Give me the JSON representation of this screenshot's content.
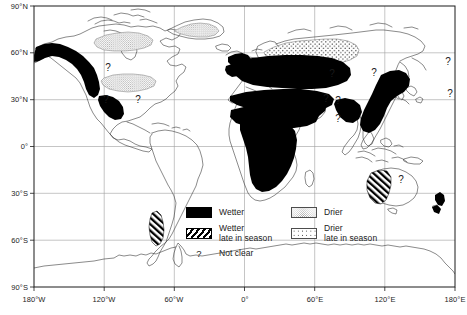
{
  "figure": {
    "type": "map",
    "projection": "equirectangular",
    "title": "",
    "frame": {
      "x_min_deg": -180,
      "x_max_deg": 180,
      "y_min_deg": -90,
      "y_max_deg": 90
    }
  },
  "axes": {
    "y_ticks": [
      {
        "label": "90°N",
        "value": 90
      },
      {
        "label": "60°N",
        "value": 60
      },
      {
        "label": "30°N",
        "value": 30
      },
      {
        "label": "0°",
        "value": 0
      },
      {
        "label": "30°S",
        "value": -30
      },
      {
        "label": "60°S",
        "value": -60
      },
      {
        "label": "90°S",
        "value": -90
      }
    ],
    "x_ticks": [
      {
        "label": "180°W",
        "value": -180
      },
      {
        "label": "120°W",
        "value": -120
      },
      {
        "label": "60°W",
        "value": -60
      },
      {
        "label": "0°",
        "value": 0
      },
      {
        "label": "60°E",
        "value": 60
      },
      {
        "label": "120°E",
        "value": 120
      },
      {
        "label": "180°E",
        "value": 180
      }
    ],
    "grid": true,
    "grid_color": "#9a9a9a"
  },
  "legend": {
    "entries": [
      {
        "key": "wetter",
        "label_line1": "Wetter",
        "label_line2": "",
        "pattern": "solid-black",
        "color": "#000000"
      },
      {
        "key": "wetter-late",
        "label_line1": "Wetter",
        "label_line2": "late in season",
        "pattern": "diagonal-hatch",
        "color": "#000000"
      },
      {
        "key": "not-clear",
        "label_line1": "Not clear",
        "label_line2": "",
        "pattern": "question-mark",
        "color": "#1a1a1a"
      },
      {
        "key": "drier",
        "label_line1": "Drier",
        "label_line2": "",
        "pattern": "fine-stipple",
        "color": "#8c8c8c"
      },
      {
        "key": "drier-late",
        "label_line1": "Drier",
        "label_line2": "late in season",
        "pattern": "coarse-dots",
        "color": "#111111"
      }
    ]
  },
  "map_regions": {
    "wetter": [
      {
        "name": "alaska-western-canada"
      },
      {
        "name": "mexico-central-america"
      },
      {
        "name": "western-europe-british-isles"
      },
      {
        "name": "eastern-europe-western-russia"
      },
      {
        "name": "mediterranean-north-africa"
      },
      {
        "name": "sahel-west-africa"
      },
      {
        "name": "central-southern-africa"
      },
      {
        "name": "arabian-peninsula-middle-east"
      },
      {
        "name": "east-asia-china-korea"
      },
      {
        "name": "india-south-asia"
      },
      {
        "name": "new-zealand"
      }
    ],
    "wetter_late": [
      {
        "name": "southern-chile-patagonia"
      },
      {
        "name": "western-australia"
      }
    ],
    "drier": [
      {
        "name": "central-canada"
      },
      {
        "name": "central-united-states"
      },
      {
        "name": "greenland"
      }
    ],
    "drier_late": [
      {
        "name": "northern-russia-siberia"
      }
    ],
    "not_clear": [
      {
        "name": "central-canada-marker",
        "label": "?"
      },
      {
        "name": "southwest-us-marker",
        "label": "?"
      },
      {
        "name": "southeast-us-marker",
        "label": "?"
      },
      {
        "name": "central-asia-marker",
        "label": "?"
      },
      {
        "name": "east-africa-marker",
        "label": "?"
      },
      {
        "name": "south-asia-marker",
        "label": "?"
      },
      {
        "name": "siberia-east-marker",
        "label": "?"
      },
      {
        "name": "southeast-asia-marker",
        "label": "?"
      },
      {
        "name": "north-pacific-marker",
        "label": "?"
      },
      {
        "name": "australia-marker",
        "label": "?"
      }
    ]
  }
}
